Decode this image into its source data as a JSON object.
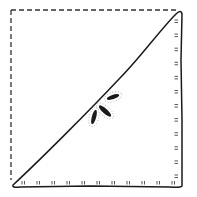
{
  "diagram": {
    "type": "fold-diagram",
    "colors": {
      "background": "#ffffff",
      "ink": "#1a1a1a",
      "dots": "#555555"
    },
    "dashed_edges": {
      "top": {
        "x1": 11,
        "y1": 10,
        "x2": 177,
        "y2": 10
      },
      "left": {
        "x1": 11,
        "y1": 10,
        "x2": 11,
        "y2": 180
      }
    },
    "triangle": {
      "points": [
        [
          13,
          185
        ],
        [
          180,
          10
        ],
        [
          182,
          187
        ]
      ]
    },
    "stitches": {
      "bottom_count": 11,
      "right_count": 12
    },
    "marks": [
      {
        "cx": 113,
        "cy": 97,
        "rx": 6.5,
        "ry": 2.2,
        "rotate": -18
      },
      {
        "cx": 105,
        "cy": 111,
        "rx": 8,
        "ry": 2.5,
        "rotate": 42
      },
      {
        "cx": 94,
        "cy": 117,
        "rx": 7.5,
        "ry": 2.2,
        "rotate": -75
      }
    ]
  }
}
